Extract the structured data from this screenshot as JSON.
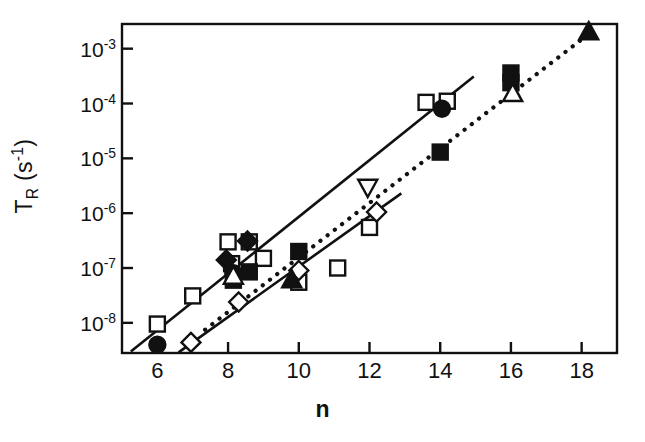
{
  "chart_data": {
    "type": "scatter",
    "title": "",
    "xlabel": "n",
    "ylabel": "T_R (s^-1)",
    "ylabel_base": "T",
    "ylabel_sub": "R",
    "ylabel_units": "(s",
    "ylabel_units_sup": "-1",
    "ylabel_units_close": ")",
    "xlim": [
      5.0,
      19.0
    ],
    "ylim_exponent": [
      -8.55,
      -2.55
    ],
    "yscale": "log",
    "grid": false,
    "legend": "none",
    "xticks": [
      6,
      8,
      10,
      12,
      14,
      16,
      18
    ],
    "xtick_labels": [
      "6",
      "8",
      "10",
      "12",
      "14",
      "16",
      "18"
    ],
    "yticks_exponent": [
      -3,
      -4,
      -5,
      -6,
      -7,
      -8
    ],
    "ytick_labels": [
      "10-3",
      "10-4",
      "10-5",
      "10-6",
      "10-7",
      "10-8"
    ],
    "ytick_mantissa": "10",
    "ytick_exponents": [
      "-3",
      "-4",
      "-5",
      "-6",
      "-7",
      "-8"
    ],
    "series": [
      {
        "name": "open-square",
        "marker": "square",
        "fill": "open",
        "points": [
          {
            "x": 6.0,
            "y": 9.5e-09
          },
          {
            "x": 7.0,
            "y": 3.1e-08
          },
          {
            "x": 8.0,
            "y": 3e-07
          },
          {
            "x": 8.6,
            "y": 3e-07
          },
          {
            "x": 8.1,
            "y": 1.2e-07
          },
          {
            "x": 9.0,
            "y": 1.5e-07
          },
          {
            "x": 10.0,
            "y": 5.5e-08
          },
          {
            "x": 11.1,
            "y": 1e-07
          },
          {
            "x": 12.0,
            "y": 5.5e-07
          },
          {
            "x": 13.6,
            "y": 0.000105
          },
          {
            "x": 14.2,
            "y": 0.00011
          }
        ]
      },
      {
        "name": "filled-square",
        "marker": "square",
        "fill": "filled",
        "points": [
          {
            "x": 8.15,
            "y": 6e-08
          },
          {
            "x": 8.6,
            "y": 8.5e-08
          },
          {
            "x": 10.0,
            "y": 2e-07
          },
          {
            "x": 14.0,
            "y": 1.3e-05
          },
          {
            "x": 16.0,
            "y": 0.00036
          },
          {
            "x": 16.0,
            "y": 0.00024
          }
        ]
      },
      {
        "name": "filled-diamond",
        "marker": "diamond",
        "fill": "filled",
        "points": [
          {
            "x": 7.95,
            "y": 1.4e-07
          },
          {
            "x": 8.55,
            "y": 3.1e-07
          }
        ]
      },
      {
        "name": "open-diamond",
        "marker": "diamond",
        "fill": "open",
        "points": [
          {
            "x": 6.95,
            "y": 4.4e-09
          },
          {
            "x": 8.3,
            "y": 2.4e-08
          },
          {
            "x": 10.0,
            "y": 9e-08
          },
          {
            "x": 12.2,
            "y": 1.05e-06
          }
        ]
      },
      {
        "name": "filled-circle",
        "marker": "circle",
        "fill": "filled",
        "points": [
          {
            "x": 6.0,
            "y": 4e-09
          },
          {
            "x": 8.15,
            "y": 8e-08
          },
          {
            "x": 14.05,
            "y": 8e-05
          }
        ]
      },
      {
        "name": "open-triangle-up",
        "marker": "triangle-up",
        "fill": "open",
        "points": [
          {
            "x": 8.15,
            "y": 7e-08
          },
          {
            "x": 16.05,
            "y": 0.00015
          }
        ]
      },
      {
        "name": "filled-triangle-up",
        "marker": "triangle-up",
        "fill": "filled",
        "points": [
          {
            "x": 9.8,
            "y": 6e-08
          },
          {
            "x": 18.2,
            "y": 0.002
          }
        ]
      },
      {
        "name": "open-triangle-down",
        "marker": "triangle-down",
        "fill": "open",
        "points": [
          {
            "x": 11.95,
            "y": 3e-06
          }
        ]
      }
    ],
    "trend_lines": [
      {
        "name": "upper-solid-fit",
        "style": "solid",
        "x0": 5.25,
        "y0": 3e-09,
        "x1": 14.95,
        "y1": 0.00031
      },
      {
        "name": "dotted-fit",
        "style": "dotted",
        "x0": 7.35,
        "y0": 7.5e-09,
        "x1": 18.35,
        "y1": 0.0022
      },
      {
        "name": "lower-solid-fit",
        "style": "solid",
        "x0": 6.6,
        "y0": 2.9e-09,
        "x1": 12.9,
        "y1": 2.3e-06
      }
    ]
  },
  "axes": {
    "frame_color": "#111111"
  }
}
